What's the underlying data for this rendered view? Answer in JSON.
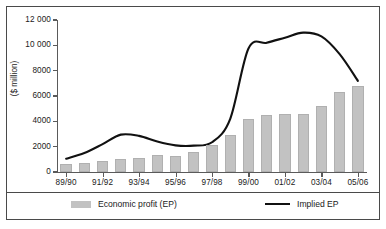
{
  "chart_data": {
    "type": "bar",
    "title": "",
    "subtitle": "",
    "xlabel": "",
    "ylabel": "($ million)",
    "ylim": [
      0,
      12000
    ],
    "ytick_values": [
      0,
      2000,
      4000,
      6000,
      8000,
      10000,
      12000
    ],
    "ytick_labels": [
      "0",
      "2000",
      "4000",
      "6000",
      "8000",
      "10 000",
      "12 000"
    ],
    "grid": false,
    "legend_position": "bottom",
    "categories": [
      "89/90",
      "90/91",
      "91/92",
      "92/93",
      "93/94",
      "94/95",
      "95/96",
      "96/97",
      "97/98",
      "98/99",
      "99/00",
      "00/01",
      "01/02",
      "02/03",
      "03/04",
      "04/05",
      "05/06"
    ],
    "xtick_labels_shown": [
      "89/90",
      "91/92",
      "93/94",
      "95/96",
      "97/98",
      "99/00",
      "01/02",
      "03/04",
      "05/06"
    ],
    "series": [
      {
        "name": "Economic profit (EP)",
        "type": "bar",
        "color": "#c2c2c2",
        "values": [
          650,
          750,
          850,
          1000,
          1100,
          1350,
          1300,
          1600,
          2100,
          2900,
          4200,
          4500,
          4600,
          4580,
          5200,
          6300,
          6800
        ]
      },
      {
        "name": "Implied EP",
        "type": "line",
        "color": "#111111",
        "values": [
          1050,
          1500,
          2200,
          2950,
          2850,
          2400,
          2100,
          2080,
          2350,
          4200,
          9750,
          10200,
          10600,
          11000,
          10700,
          9300,
          7200
        ]
      }
    ]
  },
  "legend": {
    "bar_label": "Economic profit (EP)",
    "line_label": "Implied EP"
  },
  "colors": {
    "bar_fill": "#c2c2c2",
    "line_stroke": "#111111",
    "axis": "#5a5a5a",
    "frame": "#4a4a4a",
    "text": "#1a1a1a"
  }
}
